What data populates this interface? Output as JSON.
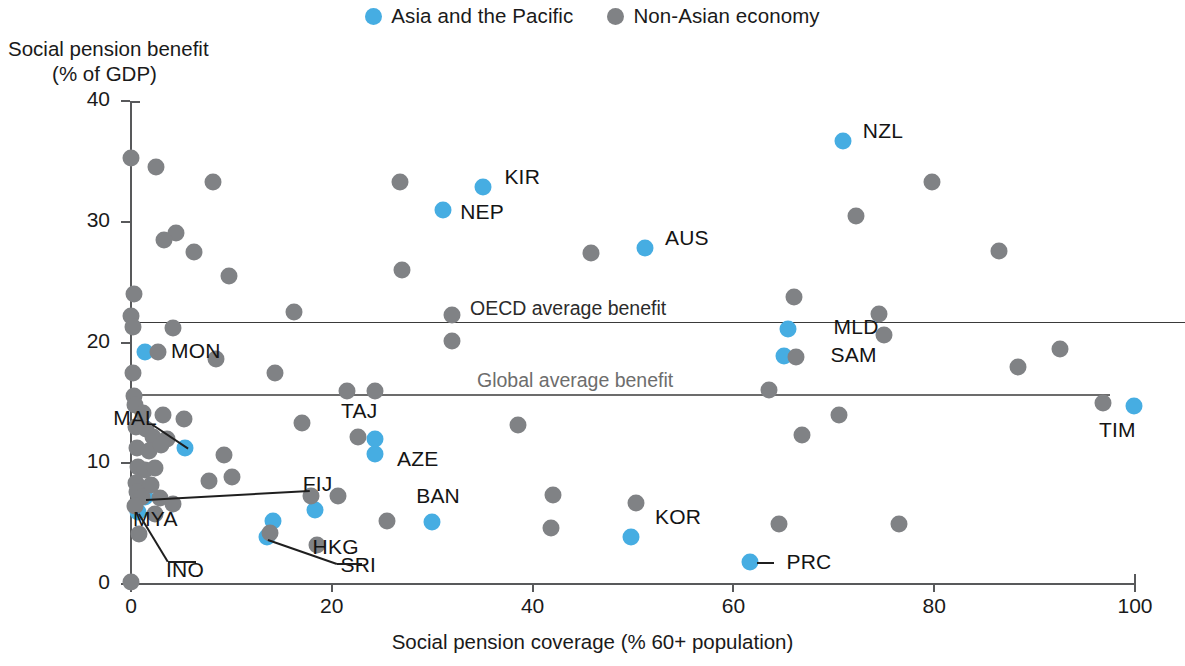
{
  "legend": {
    "items": [
      {
        "label": "Asia and the Pacific",
        "color": "#46ADE2",
        "icon": "circle-marker-icon"
      },
      {
        "label": "Non-Asian economy",
        "color": "#808285",
        "icon": "circle-marker-icon"
      }
    ]
  },
  "axes": {
    "y_title_line1": "Social pension benefit",
    "y_title_line2": "(% of GDP)",
    "x_title": "Social pension coverage (% 60+ population)",
    "y_ticks": [
      "40",
      "30",
      "20",
      "10",
      "0"
    ],
    "x_ticks": [
      "0",
      "20",
      "40",
      "60",
      "80",
      "100"
    ]
  },
  "reference_lines": [
    {
      "label": "OECD average benefit",
      "value": 21.7
    },
    {
      "label": "Global average benefit",
      "value": 15.7
    }
  ],
  "chart_data": {
    "type": "scatter",
    "title": "",
    "xlabel": "Social pension coverage (% 60+ population)",
    "ylabel": "Social pension benefit (% of GDP)",
    "xlim": [
      0,
      100
    ],
    "ylim": [
      0,
      40
    ],
    "grid": false,
    "legend_position": "top-center",
    "annotations": [
      {
        "text": "OECD average benefit",
        "y": 21.7,
        "type": "hline"
      },
      {
        "text": "Global average benefit",
        "y": 15.7,
        "type": "hline"
      }
    ],
    "series": [
      {
        "name": "Asia and the Pacific",
        "color": "#46ADE2",
        "points": [
          {
            "label": "NZL",
            "x": 70.9,
            "y": 36.7,
            "label_pos": "right"
          },
          {
            "label": "KIR",
            "x": 35.1,
            "y": 32.9,
            "label_pos": "right"
          },
          {
            "label": "NEP",
            "x": 31.1,
            "y": 31.0,
            "label_pos": "right-below"
          },
          {
            "label": "AUS",
            "x": 51.2,
            "y": 27.8,
            "label_pos": "right"
          },
          {
            "label": "MLD",
            "x": 65.4,
            "y": 21.1,
            "label_pos": "right-far"
          },
          {
            "label": "SAM",
            "x": 65.0,
            "y": 18.9,
            "label_pos": "right-far"
          },
          {
            "label": "TIM",
            "x": 99.9,
            "y": 14.7,
            "label_pos": "left-below"
          },
          {
            "label": "MON",
            "x": 1.4,
            "y": 19.2,
            "label_pos": "right"
          },
          {
            "label": "MAL",
            "x": 5.4,
            "y": 11.3,
            "label_pos": "leader-left"
          },
          {
            "label": "TAJ",
            "x": 24.3,
            "y": 12.0,
            "label_pos": "left-above"
          },
          {
            "label": "AZE",
            "x": 24.3,
            "y": 10.8,
            "label_pos": "right"
          },
          {
            "label": "MYA",
            "x": 1.4,
            "y": 7.2,
            "label_pos": "leader-right"
          },
          {
            "label": "INO",
            "x": 0.7,
            "y": 6.0,
            "label_pos": "leader-below"
          },
          {
            "label": "FIJ",
            "x": 18.3,
            "y": 6.1,
            "label_pos": "left-above"
          },
          {
            "label": "HKG",
            "x": 14.1,
            "y": 5.2,
            "label_pos": "right-below"
          },
          {
            "label": "SRI",
            "x": 13.5,
            "y": 3.9,
            "label_pos": "leader-right"
          },
          {
            "label": "BAN",
            "x": 30.0,
            "y": 5.1,
            "label_pos": "left-above"
          },
          {
            "label": "KOR",
            "x": 49.8,
            "y": 3.9,
            "label_pos": "right-above"
          },
          {
            "label": "PRC",
            "x": 61.7,
            "y": 1.8,
            "label_pos": "right"
          }
        ]
      },
      {
        "name": "Non-Asian economy",
        "color": "#808285",
        "points": [
          {
            "x": 0.0,
            "y": 35.3
          },
          {
            "x": 2.5,
            "y": 34.5
          },
          {
            "x": 8.2,
            "y": 33.3
          },
          {
            "x": 26.8,
            "y": 33.3
          },
          {
            "x": 79.8,
            "y": 33.3
          },
          {
            "x": 72.2,
            "y": 30.5
          },
          {
            "x": 4.5,
            "y": 29.1
          },
          {
            "x": 3.3,
            "y": 28.5
          },
          {
            "x": 6.3,
            "y": 27.5
          },
          {
            "x": 86.5,
            "y": 27.6
          },
          {
            "x": 45.8,
            "y": 27.4
          },
          {
            "x": 27.0,
            "y": 26.0
          },
          {
            "x": 9.8,
            "y": 25.5
          },
          {
            "x": 0.3,
            "y": 24.0
          },
          {
            "x": 66.0,
            "y": 23.8
          },
          {
            "x": 16.2,
            "y": 22.5
          },
          {
            "x": 32.0,
            "y": 22.3
          },
          {
            "x": 74.5,
            "y": 22.4
          },
          {
            "x": 0.0,
            "y": 22.2
          },
          {
            "x": 0.2,
            "y": 21.3
          },
          {
            "x": 4.2,
            "y": 21.2
          },
          {
            "x": 32.0,
            "y": 20.1
          },
          {
            "x": 75.0,
            "y": 20.6
          },
          {
            "x": 92.5,
            "y": 19.5
          },
          {
            "x": 2.7,
            "y": 19.2
          },
          {
            "x": 66.2,
            "y": 18.8
          },
          {
            "x": 88.3,
            "y": 18.0
          },
          {
            "x": 8.5,
            "y": 18.6
          },
          {
            "x": 0.2,
            "y": 17.5
          },
          {
            "x": 14.3,
            "y": 17.5
          },
          {
            "x": 63.5,
            "y": 16.1
          },
          {
            "x": 0.3,
            "y": 15.6
          },
          {
            "x": 0.4,
            "y": 14.8
          },
          {
            "x": 21.5,
            "y": 16.0
          },
          {
            "x": 24.3,
            "y": 16.0
          },
          {
            "x": 96.8,
            "y": 15.0
          },
          {
            "x": 1.2,
            "y": 14.2
          },
          {
            "x": 3.2,
            "y": 14.0
          },
          {
            "x": 5.3,
            "y": 13.7
          },
          {
            "x": 17.0,
            "y": 13.3
          },
          {
            "x": 38.5,
            "y": 13.2
          },
          {
            "x": 70.5,
            "y": 14.0
          },
          {
            "x": 0.5,
            "y": 13.0
          },
          {
            "x": 1.5,
            "y": 12.8
          },
          {
            "x": 2.2,
            "y": 12.2
          },
          {
            "x": 3.6,
            "y": 12.0
          },
          {
            "x": 22.6,
            "y": 12.2
          },
          {
            "x": 66.8,
            "y": 12.3
          },
          {
            "x": 0.6,
            "y": 11.3
          },
          {
            "x": 1.8,
            "y": 11.0
          },
          {
            "x": 3.0,
            "y": 11.5
          },
          {
            "x": 9.3,
            "y": 10.7
          },
          {
            "x": 0.7,
            "y": 9.7
          },
          {
            "x": 1.4,
            "y": 9.4
          },
          {
            "x": 2.4,
            "y": 9.6
          },
          {
            "x": 10.1,
            "y": 8.9
          },
          {
            "x": 0.5,
            "y": 8.4
          },
          {
            "x": 2.0,
            "y": 8.2
          },
          {
            "x": 7.8,
            "y": 8.5
          },
          {
            "x": 0.6,
            "y": 7.6
          },
          {
            "x": 1.1,
            "y": 7.2
          },
          {
            "x": 2.9,
            "y": 7.1
          },
          {
            "x": 17.9,
            "y": 7.3
          },
          {
            "x": 20.6,
            "y": 7.3
          },
          {
            "x": 42.0,
            "y": 7.4
          },
          {
            "x": 50.3,
            "y": 6.7
          },
          {
            "x": 0.4,
            "y": 6.5
          },
          {
            "x": 4.2,
            "y": 6.6
          },
          {
            "x": 2.4,
            "y": 5.8
          },
          {
            "x": 25.5,
            "y": 5.2
          },
          {
            "x": 41.8,
            "y": 4.6
          },
          {
            "x": 64.5,
            "y": 5.0
          },
          {
            "x": 76.5,
            "y": 5.0
          },
          {
            "x": 0.8,
            "y": 4.1
          },
          {
            "x": 13.8,
            "y": 4.2
          },
          {
            "x": 18.5,
            "y": 3.2
          },
          {
            "x": 0.0,
            "y": 0.2
          }
        ]
      }
    ]
  }
}
